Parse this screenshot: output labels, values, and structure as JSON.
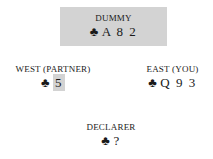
{
  "dummy": {
    "label": "DUMMY",
    "suit": "♣",
    "cards": "A 8 2"
  },
  "west": {
    "label": "WEST (PARTNER)",
    "suit": "♣",
    "cards": "5",
    "highlight": true
  },
  "east": {
    "label": "EAST (YOU)",
    "suit": "♣",
    "cards": "Q 9 3"
  },
  "declarer": {
    "label": "DECLARER",
    "suit": "♣",
    "cards": "?"
  },
  "colors": {
    "dummy_bg": "#d3d3d3",
    "highlight_bg": "#d3d3d3",
    "text": "#1a1a1a"
  }
}
